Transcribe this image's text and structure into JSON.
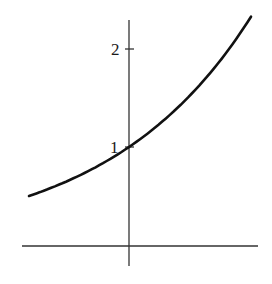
{
  "chart_data": {
    "type": "line",
    "title": "",
    "xlabel": "",
    "ylabel": "",
    "function": "y = 2^x",
    "series": [
      {
        "name": "exponential curve",
        "x": [
          -1.0,
          -0.75,
          -0.5,
          -0.25,
          0.0,
          0.25,
          0.5,
          0.75,
          1.0,
          1.22
        ],
        "values": [
          0.5,
          0.59,
          0.71,
          0.84,
          1.0,
          1.19,
          1.41,
          1.68,
          2.0,
          2.33
        ]
      }
    ],
    "y_ticks": [
      "1",
      "2"
    ],
    "y_tick_values": [
      1,
      2
    ],
    "xlim": [
      -1.07,
      1.29
    ],
    "ylim": [
      -0.2,
      2.29
    ],
    "grid": false,
    "legend": "none"
  },
  "labels": {
    "tick_1": "1",
    "tick_2": "2"
  }
}
